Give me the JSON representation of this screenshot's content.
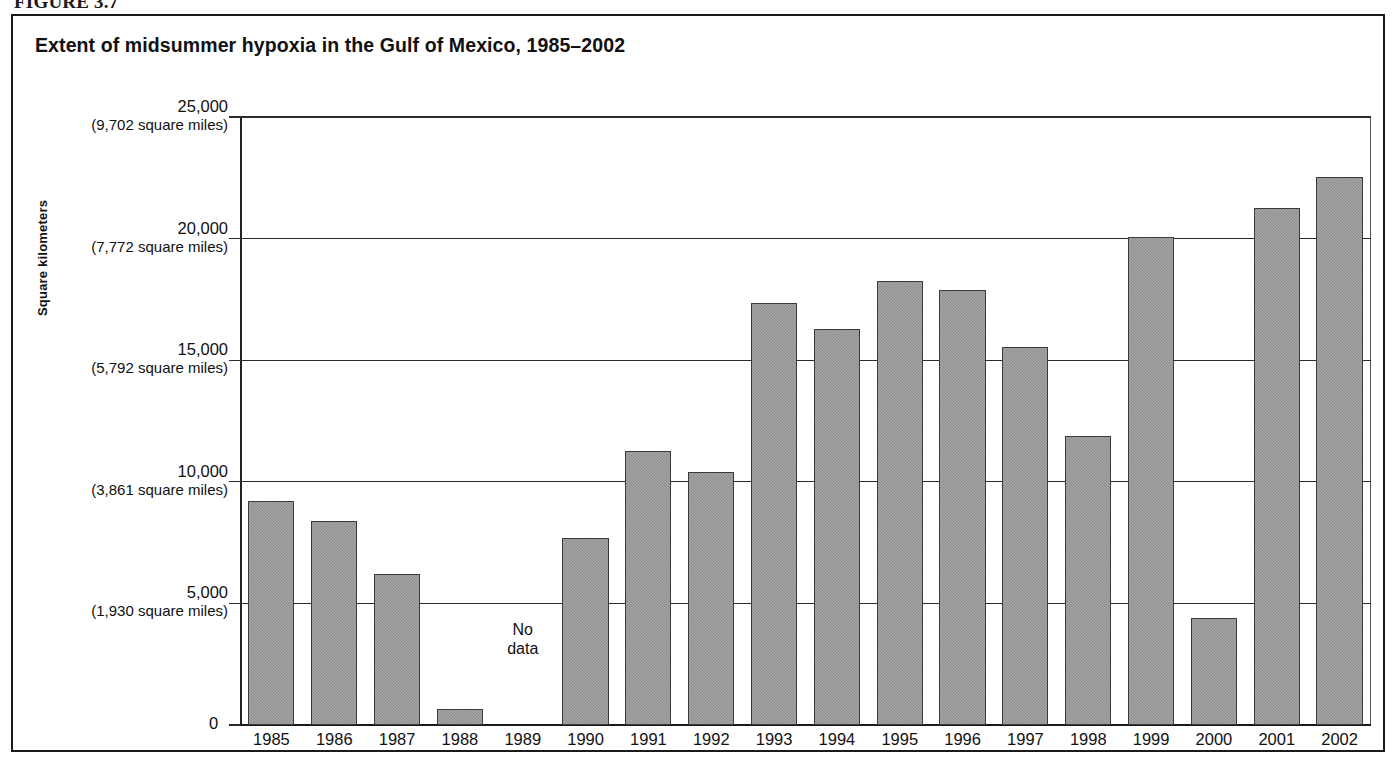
{
  "figure": {
    "caption": "FIGURE 3.7",
    "title": "Extent of midsummer hypoxia in the Gulf of Mexico, 1985–2002"
  },
  "axes": {
    "y_title": "Square kilometers",
    "zero_label": "0",
    "y_ticks": [
      {
        "main": "25,000",
        "sub": "(9,702 square miles)",
        "value": 25000
      },
      {
        "main": "20,000",
        "sub": "(7,772 square miles)",
        "value": 20000
      },
      {
        "main": "15,000",
        "sub": "(5,792 square miles)",
        "value": 15000
      },
      {
        "main": "10,000",
        "sub": "(3,861 square miles)",
        "value": 10000
      },
      {
        "main": "5,000",
        "sub": "(1,930 square miles)",
        "value": 5000
      }
    ],
    "no_data_label_line1": "No",
    "no_data_label_line2": "data"
  },
  "chart_data": {
    "type": "bar",
    "title": "Extent of midsummer hypoxia in the Gulf of Mexico, 1985–2002",
    "xlabel": "",
    "ylabel": "Square kilometers",
    "ylim": [
      0,
      25000
    ],
    "grid": true,
    "legend": "none",
    "categories": [
      "1985",
      "1986",
      "1987",
      "1988",
      "1989",
      "1990",
      "1991",
      "1992",
      "1993",
      "1994",
      "1995",
      "1996",
      "1997",
      "1998",
      "1999",
      "2000",
      "2001",
      "2002"
    ],
    "values": [
      9200,
      8400,
      6200,
      660,
      null,
      7700,
      11250,
      10400,
      17350,
      16300,
      18250,
      17900,
      15550,
      11900,
      20050,
      4400,
      21250,
      22550
    ],
    "missing": [
      "1989"
    ],
    "annotations": [
      {
        "category": "1989",
        "text": "No data"
      }
    ]
  }
}
